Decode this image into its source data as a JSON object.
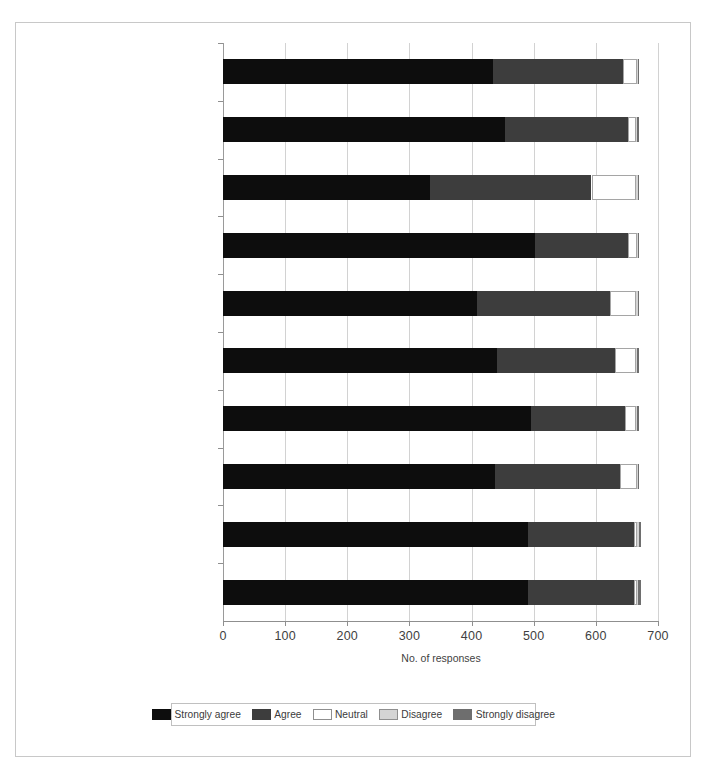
{
  "figure": {
    "x_axis_title": "No. of responses",
    "x_ticks": [
      "0",
      "100",
      "200",
      "300",
      "400",
      "500",
      "600",
      "700"
    ]
  },
  "legend": {
    "items": [
      {
        "label": "Strongly agree",
        "color": "#0d0d0d"
      },
      {
        "label": "Agree",
        "color": "#3d3d3d"
      },
      {
        "label": "Neutral",
        "color": "#ffffff"
      },
      {
        "label": "Disagree",
        "color": "#d4d4d4"
      },
      {
        "label": "Strongly disagree",
        "color": "#6e6e6e"
      }
    ]
  },
  "chart_data": {
    "type": "bar",
    "orientation": "horizontal",
    "stacked": true,
    "title": "",
    "xlabel": "No. of responses",
    "ylabel": "",
    "xlim": [
      0,
      700
    ],
    "xticks": [
      0,
      100,
      200,
      300,
      400,
      500,
      600,
      700
    ],
    "grid": "vertical",
    "legend_position": "bottom",
    "categories": [
      "Past or current symptoms or conditions associated with significant pain and discomfort",
      "Past or current sleep disorders, including sleep apnea",
      "Sexual and reproductive history",
      "Past or current neurological disorders or symptoms",
      "Past or current infectious disease, including but not limited to sexually transmitted diseases, HIV, tuberculosis, and hepatitis C",
      "Past or current endocrinological disease",
      "Allergies or drug sensitivities",
      "Important past or current treatments or procedures, including complementary and alternative medical treatments",
      "Past or current general medical illnesses and related hospitalizations",
      "Physical trauma, including head injuries"
    ],
    "category_lines": [
      [
        "Past or current symptoms or conditions",
        "associated with significant pain",
        "and discomfort"
      ],
      [
        "Past or current sleep disorders, including",
        "sleep apnea"
      ],
      [
        "Sexual and reproductive history"
      ],
      [
        "Past or current neurological disorders",
        "or symptoms"
      ],
      [
        "Past or current infectious disease, including",
        "but not limited to sexually transmitted",
        "diseases, HIV, tuberculosis, and hepatitis C"
      ],
      [
        "Past or current endocrinological disease"
      ],
      [
        "Allergies or drug sensitivities"
      ],
      [
        "Important past or current treatments or",
        "procedures, including complementary and",
        "alternative medical treatments"
      ],
      [
        "Past or current general medical illnesses",
        "and related hospitalizations"
      ],
      [
        "Physical trauma, including head injuries"
      ]
    ],
    "series": [
      {
        "name": "Strongly agree",
        "color": "#0d0d0d",
        "values": [
          435,
          454,
          333,
          502,
          409,
          441,
          496,
          438,
          490,
          491
        ]
      },
      {
        "name": "Agree",
        "color": "#3d3d3d",
        "values": [
          209,
          197,
          260,
          150,
          214,
          190,
          151,
          201,
          172,
          171
        ]
      },
      {
        "name": "Neutral",
        "color": "#ffffff",
        "values": [
          22,
          14,
          72,
          14,
          42,
          33,
          17,
          27,
          5,
          4
        ]
      },
      {
        "name": "Disagree",
        "color": "#d4d4d4",
        "values": [
          2,
          2,
          3,
          2,
          3,
          3,
          3,
          2,
          2,
          2
        ]
      },
      {
        "name": "Strongly disagree",
        "color": "#6e6e6e",
        "values": [
          2,
          3,
          2,
          2,
          2,
          3,
          3,
          2,
          3,
          4
        ]
      }
    ],
    "totals": [
      670,
      670,
      670,
      670,
      670,
      670,
      670,
      670,
      672,
      672
    ]
  }
}
